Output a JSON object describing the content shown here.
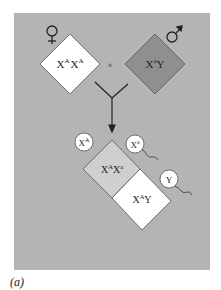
{
  "diagram": {
    "panel_color": "#b4b4b4",
    "female_symbol": "♀",
    "male_symbol": "♂",
    "cross_symbol": "×",
    "female_parent": {
      "base1": "X",
      "sup1": "A",
      "base2": "X",
      "sup2": "A",
      "fill": "#ffffff"
    },
    "male_parent": {
      "base1": "X",
      "sup1": "a",
      "base2": "Y",
      "fill": "#8f8f8f"
    },
    "egg": {
      "base": "X",
      "sup": "A"
    },
    "sperm": [
      {
        "base": "X",
        "sup": "a"
      },
      {
        "base": "Y",
        "sup": ""
      }
    ],
    "offspring": [
      {
        "base1": "X",
        "sup1": "A",
        "base2": "X",
        "sup2": "a",
        "fill": "#cfcfcf"
      },
      {
        "base1": "X",
        "sup1": "A",
        "base2": "Y",
        "fill": "#ffffff"
      }
    ]
  },
  "caption": "(a)"
}
